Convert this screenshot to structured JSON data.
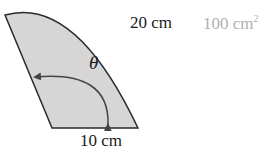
{
  "figure": {
    "outer_arc_label": "20 cm",
    "area_label": "100 cm",
    "area_exponent": "2",
    "base_label": "10 cm",
    "angle_label": "θ",
    "colors": {
      "fill": "#d6d6d6",
      "stroke": "#2a2a2a",
      "area_text": "#b0b0b0"
    }
  }
}
